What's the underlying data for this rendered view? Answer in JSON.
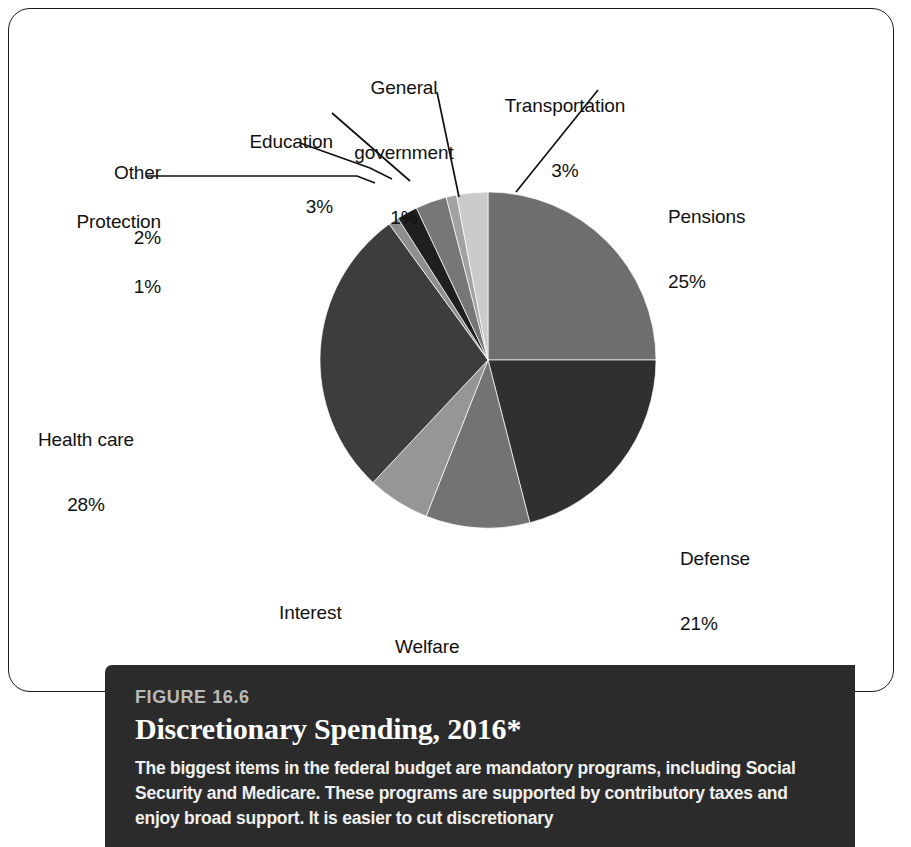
{
  "chart_data": {
    "type": "pie",
    "title": "Discretionary Spending, 2016*",
    "unit": "%",
    "total": 100,
    "legend": "none",
    "labels_position": "outside-with-leader-lines",
    "start_angle_deg": 0,
    "direction": "clockwise",
    "categories": [
      "Pensions",
      "Defense",
      "Welfare",
      "Interest",
      "Health care",
      "Protection",
      "Other",
      "Education",
      "General government",
      "Transportation"
    ],
    "values": [
      25,
      21,
      10,
      6,
      28,
      1,
      2,
      3,
      1,
      3
    ],
    "slices": [
      {
        "name": "Pensions",
        "value": 25,
        "pct_text": "25%",
        "color": "#6e6e6e"
      },
      {
        "name": "Defense",
        "value": 21,
        "pct_text": "21%",
        "color": "#303030"
      },
      {
        "name": "Welfare",
        "value": 10,
        "pct_text": "10%",
        "color": "#737373"
      },
      {
        "name": "Interest",
        "value": 6,
        "pct_text": "6%",
        "color": "#969696"
      },
      {
        "name": "Health care",
        "value": 28,
        "pct_text": "28%",
        "color": "#3d3d3d"
      },
      {
        "name": "Protection",
        "value": 1,
        "pct_text": "1%",
        "color": "#8f8f8f"
      },
      {
        "name": "Other",
        "value": 2,
        "pct_text": "2%",
        "color": "#1f1f1f"
      },
      {
        "name": "Education",
        "value": 3,
        "pct_text": "3%",
        "color": "#777777"
      },
      {
        "name": "General government",
        "value": 1,
        "pct_text": "1%",
        "color": "#a2a2a2"
      },
      {
        "name": "Transportation",
        "value": 3,
        "pct_text": "3%",
        "color": "#cbcbcb"
      }
    ]
  },
  "labels": {
    "pensions": {
      "name": "Pensions",
      "pct": "25%"
    },
    "defense": {
      "name": "Defense",
      "pct": "21%"
    },
    "welfare": {
      "name": "Welfare",
      "pct": "10%"
    },
    "interest": {
      "name": "Interest",
      "pct": "6%"
    },
    "healthcare": {
      "name": "Health care",
      "pct": "28%"
    },
    "protection": {
      "name": "Protection",
      "pct": "1%"
    },
    "other": {
      "name": "Other",
      "pct": "2%"
    },
    "education": {
      "name": "Education",
      "pct": "3%"
    },
    "generalgov": {
      "name_line1": "General",
      "name_line2": "government",
      "pct": "1%"
    },
    "transportation": {
      "name": "Transportation",
      "pct": "3%"
    }
  },
  "caption": {
    "figure_number": "FIGURE 16.6",
    "title": "Discretionary Spending, 2016*",
    "body": "The biggest items in the federal budget are mandatory programs, including Social Security and Medicare. These programs are supported by contributory taxes and enjoy broad support. It is easier to cut discretionary"
  },
  "geometry": {
    "center_x": 488,
    "center_y": 360,
    "radius": 168
  },
  "colors": {
    "panel_border": "#1a1a1a",
    "caption_background": "#2b2b2b",
    "caption_figure_number": "#b9b9b9",
    "caption_text": "#ffffff",
    "leader_line": "#111111"
  }
}
